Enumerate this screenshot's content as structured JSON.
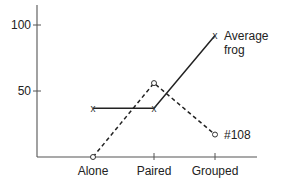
{
  "chart_data": {
    "type": "line",
    "title": "",
    "xlabel": "",
    "ylabel": "",
    "categories": [
      "Alone",
      "Paired",
      "Grouped"
    ],
    "yticks": [
      50,
      100
    ],
    "ylim": [
      0,
      120
    ],
    "grid": false,
    "series": [
      {
        "name": "Average frog",
        "label_lines": [
          "Average",
          "frog"
        ],
        "style": "solid",
        "marker": "x",
        "values": [
          37,
          37,
          92
        ]
      },
      {
        "name": "#108",
        "label_lines": [
          "#108"
        ],
        "style": "dashed",
        "marker": "o",
        "values": [
          0,
          56,
          17
        ]
      }
    ]
  }
}
